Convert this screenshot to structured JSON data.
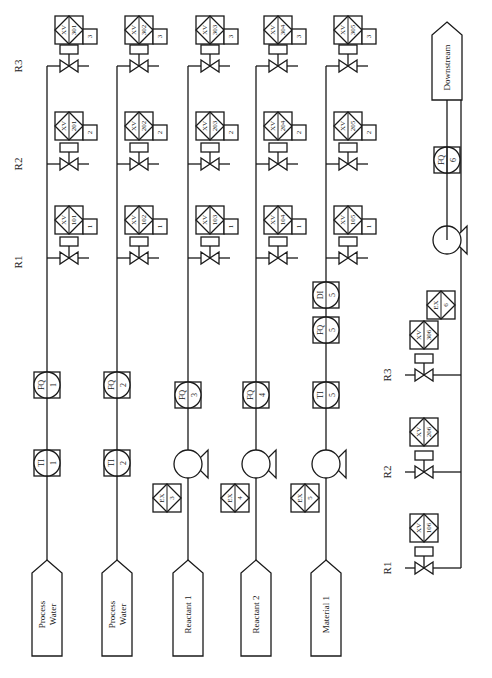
{
  "diagram": {
    "type": "process-flow-diagram",
    "orientation": "rotated-90-ccw",
    "reactor_labels": [
      "R1",
      "R2",
      "R3"
    ],
    "feed_lines": [
      {
        "source": "Process Water",
        "source_lines": [
          "Process",
          "Water"
        ],
        "instruments": [
          {
            "tag": "TI",
            "num": "1"
          },
          {
            "tag": "FQ",
            "num": "1"
          }
        ],
        "pump": null,
        "valves": [
          {
            "reactor": "R1",
            "tag": "XV",
            "num": "101",
            "pos": "1"
          },
          {
            "reactor": "R2",
            "tag": "XV",
            "num": "201",
            "pos": "2"
          },
          {
            "reactor": "R3",
            "tag": "XV",
            "num": "301",
            "pos": "3"
          }
        ]
      },
      {
        "source": "Process Water",
        "source_lines": [
          "Process",
          "Water"
        ],
        "instruments": [
          {
            "tag": "TI",
            "num": "2"
          },
          {
            "tag": "FQ",
            "num": "2"
          }
        ],
        "pump": null,
        "valves": [
          {
            "reactor": "R1",
            "tag": "XV",
            "num": "102",
            "pos": "1"
          },
          {
            "reactor": "R2",
            "tag": "XV",
            "num": "202",
            "pos": "2"
          },
          {
            "reactor": "R3",
            "tag": "XV",
            "num": "302",
            "pos": "3"
          }
        ]
      },
      {
        "source": "Reactant 1",
        "source_lines": [
          "Reactant 1"
        ],
        "instruments": [
          {
            "tag": "FQ",
            "num": "3"
          }
        ],
        "pump": {
          "tag": "EX",
          "num": "3"
        },
        "valves": [
          {
            "reactor": "R1",
            "tag": "XV",
            "num": "103",
            "pos": "1"
          },
          {
            "reactor": "R2",
            "tag": "XV",
            "num": "203",
            "pos": "2"
          },
          {
            "reactor": "R3",
            "tag": "XV",
            "num": "303",
            "pos": "3"
          }
        ]
      },
      {
        "source": "Reactant 2",
        "source_lines": [
          "Reactant 2"
        ],
        "instruments": [
          {
            "tag": "FQ",
            "num": "4"
          }
        ],
        "pump": {
          "tag": "EX",
          "num": "4"
        },
        "valves": [
          {
            "reactor": "R1",
            "tag": "XV",
            "num": "104",
            "pos": "1"
          },
          {
            "reactor": "R2",
            "tag": "XV",
            "num": "204",
            "pos": "2"
          },
          {
            "reactor": "R3",
            "tag": "XV",
            "num": "304",
            "pos": "3"
          }
        ]
      },
      {
        "source": "Material 1",
        "source_lines": [
          "Material 1"
        ],
        "instruments": [
          {
            "tag": "TI",
            "num": "5"
          },
          {
            "tag": "FQ",
            "num": "5"
          },
          {
            "tag": "DI",
            "num": "5"
          }
        ],
        "pump": {
          "tag": "EX",
          "num": "5"
        },
        "valves": [
          {
            "reactor": "R1",
            "tag": "XV",
            "num": "105",
            "pos": "1"
          },
          {
            "reactor": "R2",
            "tag": "XV",
            "num": "205",
            "pos": "2"
          },
          {
            "reactor": "R3",
            "tag": "XV",
            "num": "305",
            "pos": "3"
          }
        ]
      }
    ],
    "discharge_line": {
      "destination": "Downstream",
      "pump": {
        "tag": "EX",
        "num": "6"
      },
      "instruments": [
        {
          "tag": "FQ",
          "num": "6"
        }
      ],
      "valves": [
        {
          "reactor": "R1",
          "tag": "XV",
          "num": "106"
        },
        {
          "reactor": "R2",
          "tag": "XV",
          "num": "206"
        },
        {
          "reactor": "R3",
          "tag": "XV",
          "num": "306"
        }
      ]
    }
  },
  "colors": {
    "line": "#1a1a1a",
    "background": "#ffffff"
  }
}
